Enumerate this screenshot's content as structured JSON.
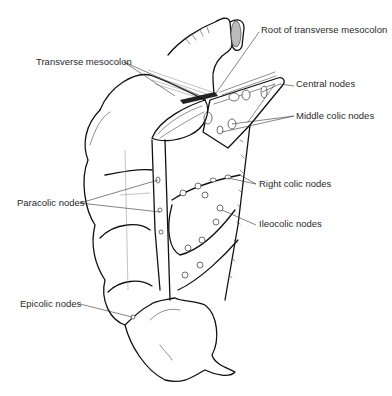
{
  "figure": {
    "labels": {
      "root_of_transverse_mesocolon": "Root of transverse mesocolon",
      "transverse_mesocolon": "Transverse mesocolon",
      "central_nodes": "Central nodes",
      "middle_colic_nodes": "Middle colic nodes",
      "right_colic_nodes": "Right colic nodes",
      "paracolic_nodes": "Paracolic nodes",
      "ileocolic_nodes": "Ileocolic nodes",
      "epicolic_nodes": "Epicolic nodes"
    }
  }
}
